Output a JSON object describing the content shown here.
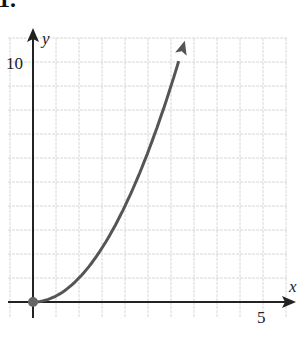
{
  "problem_label": "1.",
  "chart_data": {
    "type": "line",
    "title": "",
    "xlabel": "x",
    "ylabel": "y",
    "x_tick_labels": [
      {
        "value": 5,
        "label": "5"
      }
    ],
    "y_tick_labels": [
      {
        "value": 10,
        "label": "10"
      }
    ],
    "xlim": [
      -0.5,
      5.6
    ],
    "ylim": [
      -1,
      11
    ],
    "grid": true,
    "grid_step_x": 0.5,
    "grid_step_y": 1,
    "series": [
      {
        "name": "y = x^2",
        "x": [
          0,
          0.5,
          1,
          1.5,
          2,
          2.5,
          3,
          3.3
        ],
        "y": [
          0,
          0.25,
          1,
          2.25,
          4,
          6.25,
          9,
          10.9
        ],
        "start_point": {
          "x": 0,
          "y": 0,
          "closed": true
        },
        "end_arrow": true,
        "color": "#555555"
      }
    ]
  }
}
